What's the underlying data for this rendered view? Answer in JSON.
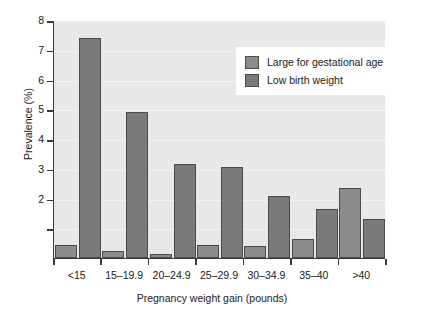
{
  "chart_data": {
    "type": "bar",
    "title": "",
    "xlabel": "Pregnancy weight gain (pounds)",
    "ylabel": "Prevalence (%)",
    "categories": [
      "<15",
      "15–19.9",
      "20–24.9",
      "25–29.9",
      "30–34.9",
      "35–40",
      ">40"
    ],
    "series": [
      {
        "name": "Large for gestational age",
        "color": "#8c8c8c",
        "values": [
          0.45,
          0.22,
          0.15,
          0.45,
          0.4,
          0.65,
          2.35
        ]
      },
      {
        "name": "Low birth weight",
        "color": "#7a7a7a",
        "values": [
          7.4,
          4.9,
          3.15,
          3.05,
          2.1,
          1.65,
          1.3
        ]
      }
    ],
    "ylim": [
      0,
      8
    ],
    "yticks": [
      2,
      3,
      4,
      5,
      6,
      7,
      8
    ],
    "yticklabels": [
      "2",
      "3",
      "4",
      "5",
      "6",
      "7",
      "8"
    ],
    "minor_yticks": [
      1
    ],
    "grid": true,
    "legend_position": "upper right",
    "plot_background": "#e8e8e8",
    "axis_color": "#3a3a3a"
  },
  "legend": {
    "entries": [
      {
        "label": "Large for gestational age"
      },
      {
        "label": "Low birth weight"
      }
    ]
  }
}
